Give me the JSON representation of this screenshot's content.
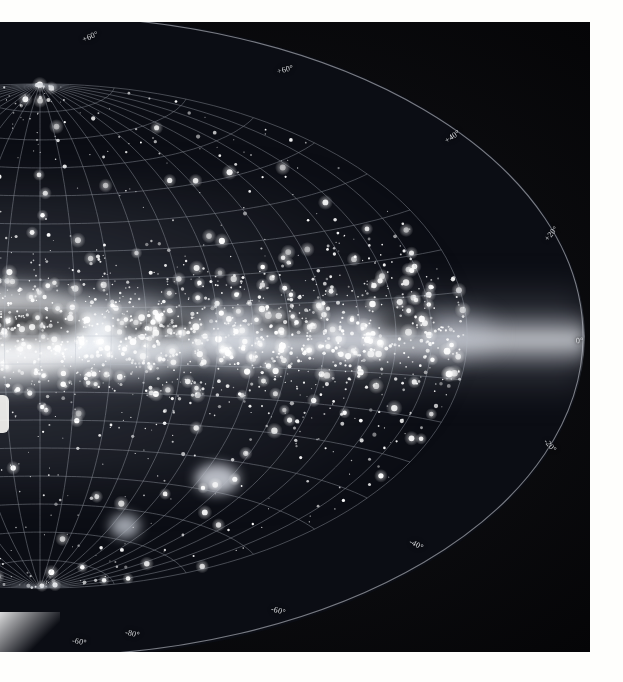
{
  "image": {
    "title": "All-sky photographic mosaic of the Milky Way in galactic coordinates",
    "projection": "Aitoff equal-area (half of the full ellipse shown)",
    "medium": "photographic plate scan with white paper margins",
    "background_color": "#050507",
    "sky_color": "#0b0d14",
    "grid_color": "#b9bec8",
    "label_color": "#e8eaee"
  },
  "chart_data": {
    "type": "scatter",
    "xlabel": "Galactic longitude",
    "ylabel": "Galactic latitude",
    "grid": true,
    "legend": "none",
    "projection": "aitoff",
    "xlim": [
      -180,
      180
    ],
    "ylim": [
      -90,
      90
    ],
    "latitude_ticks": [
      80,
      60,
      40,
      20,
      0,
      -20,
      -40,
      -60,
      -80
    ],
    "longitude_tick_spacing_deg": 15,
    "latitude_tick_spacing_deg": 10,
    "annotations": [
      {
        "text": "+60°",
        "x_px": 82,
        "y_px": 32,
        "rotation": -22
      },
      {
        "text": "+60°",
        "x_px": 277,
        "y_px": 65,
        "rotation": -14
      },
      {
        "text": "+40°",
        "x_px": 444,
        "y_px": 132,
        "rotation": -34
      },
      {
        "text": "+20°",
        "x_px": 543,
        "y_px": 229,
        "rotation": -50
      },
      {
        "text": "0°",
        "x_px": 576,
        "y_px": 336,
        "rotation": -2
      },
      {
        "text": "-20°",
        "x_px": 543,
        "y_px": 441,
        "rotation": 48
      },
      {
        "text": "-40°",
        "x_px": 409,
        "y_px": 540,
        "rotation": 28
      },
      {
        "text": "-60°",
        "x_px": 271,
        "y_px": 606,
        "rotation": 16
      },
      {
        "text": "-60°",
        "x_px": 72,
        "y_px": 637,
        "rotation": 10
      },
      {
        "text": "-80°",
        "x_px": 125,
        "y_px": 629,
        "rotation": 12
      }
    ],
    "features": [
      {
        "name": "galactic-plane-band",
        "description": "bright luminous band of unresolved stars running horizontally across the middle of the ellipse"
      },
      {
        "name": "galactic-bulge",
        "description": "brightest swelling of the band toward the left edge of the frame"
      },
      {
        "name": "dark-dust-lanes",
        "description": "dark obscuring clouds cutting along the galactic plane"
      },
      {
        "name": "large-magellanic-cloud",
        "description": "detached bright patch below the plane at lower left"
      },
      {
        "name": "small-magellanic-cloud",
        "description": "smaller detached bright patch near the lower left"
      }
    ]
  },
  "labels": {
    "plus_80": "+80°",
    "plus_60": "+60°",
    "plus_40": "+40°",
    "plus_20": "+20°",
    "zero": "0°",
    "minus_20": "-20°",
    "minus_40": "-40°",
    "minus_60": "-60°",
    "minus_80": "-80°"
  }
}
